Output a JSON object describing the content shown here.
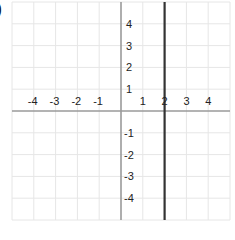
{
  "part_label": ")",
  "chart_data": {
    "type": "line",
    "title": "",
    "xlabel": "",
    "ylabel": "",
    "xlim": [
      -5,
      5
    ],
    "ylim": [
      -5,
      5
    ],
    "grid": true,
    "x_tick_labels": [
      "-4",
      "-3",
      "-2",
      "-1",
      "1",
      "2",
      "3",
      "4"
    ],
    "y_tick_labels": [
      "4",
      "3",
      "2",
      "1",
      "-1",
      "-2",
      "-3",
      "-4"
    ],
    "series": [
      {
        "name": "x = 2",
        "equation": "x = 2",
        "x": [
          2,
          2
        ],
        "y": [
          -5,
          5
        ],
        "color": "#333333"
      }
    ]
  },
  "colors": {
    "grid": "#e6e6e6",
    "axis": "#9a9a9a",
    "line": "#333333"
  }
}
